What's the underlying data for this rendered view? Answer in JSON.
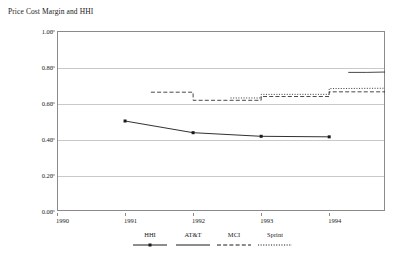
{
  "chart_data": {
    "type": "line",
    "title": "Price Cost Margin and HHI",
    "xlabel": "",
    "ylabel": "",
    "xlim": [
      1990,
      1994.82
    ],
    "ylim": [
      0.0,
      1.0
    ],
    "grid": true,
    "legend_position": "bottom-center",
    "y_ticks": [
      "0.00",
      "0.20",
      "0.40",
      "0.60",
      "0.80",
      "1.00"
    ],
    "y_tick_values": [
      0.0,
      0.2,
      0.4,
      0.6,
      0.8,
      1.0
    ],
    "x_ticks": [
      "1990",
      "1991",
      "1992",
      "1993",
      "1994"
    ],
    "x_tick_values": [
      1990,
      1991,
      1992,
      1993,
      1994
    ],
    "series": [
      {
        "name": "HHI",
        "style": "solid-with-markers",
        "color": "#1a1a1a",
        "x": [
          1991.0,
          1992.0,
          1993.0,
          1994.0
        ],
        "values": [
          0.5,
          0.435,
          0.415,
          0.412
        ]
      },
      {
        "name": "AT&T",
        "style": "solid",
        "color": "#1a1a1a",
        "x": [
          1994.28,
          1994.55,
          1994.82
        ],
        "values": [
          0.77,
          0.77,
          0.772
        ]
      },
      {
        "name": "MCI",
        "style": "dashed-step",
        "color": "#1a1a1a",
        "x": [
          1991.38,
          1992.0,
          1992.0,
          1993.0,
          1993.0,
          1994.0,
          1994.0,
          1994.82
        ],
        "values": [
          0.66,
          0.66,
          0.615,
          0.615,
          0.636,
          0.636,
          0.662,
          0.662
        ]
      },
      {
        "name": "Sprint",
        "style": "dotted-step",
        "color": "#1a1a1a",
        "x": [
          1992.55,
          1993.0,
          1993.0,
          1994.0,
          1994.0,
          1994.82
        ],
        "values": [
          0.628,
          0.628,
          0.648,
          0.648,
          0.68,
          0.682
        ]
      }
    ]
  },
  "legend": {
    "items": [
      {
        "label": "HHI",
        "style": "solid-with-markers"
      },
      {
        "label": "AT&T",
        "style": "solid"
      },
      {
        "label": "MCI",
        "style": "dashed"
      },
      {
        "label": "Sprint",
        "style": "dotted"
      }
    ]
  },
  "colors": {
    "ink": "#1a1a1a",
    "frame": "#8a8a8a",
    "grid": "#c9c9c9",
    "background": "#ffffff"
  }
}
